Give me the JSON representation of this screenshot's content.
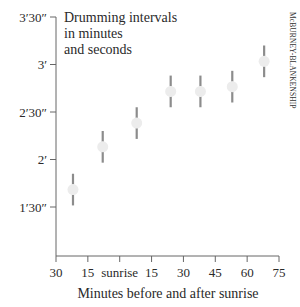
{
  "chart_data": {
    "type": "scatter",
    "title_lines": [
      "Drumming intervals",
      "in minutes",
      "and seconds"
    ],
    "xlabel": "Minutes before and after sunrise",
    "ylabel": "",
    "xlim": [
      -30,
      75
    ],
    "ylim_seconds": [
      60,
      210
    ],
    "x_ticks": [
      {
        "value": -30,
        "label": "30"
      },
      {
        "value": -15,
        "label": "15"
      },
      {
        "value": 0,
        "label": "sunrise"
      },
      {
        "value": 15,
        "label": "15"
      },
      {
        "value": 30,
        "label": "30"
      },
      {
        "value": 45,
        "label": "45"
      },
      {
        "value": 60,
        "label": "60"
      },
      {
        "value": 75,
        "label": "75"
      }
    ],
    "y_ticks": [
      {
        "value": 90,
        "label": "1′30″"
      },
      {
        "value": 120,
        "label": "2′"
      },
      {
        "value": 150,
        "label": "2′30″"
      },
      {
        "value": 180,
        "label": "3′"
      },
      {
        "value": 210,
        "label": "3′30″"
      }
    ],
    "grid": false,
    "legend": null,
    "series": [
      {
        "name": "Drumming interval (mean ± range)",
        "points": [
          {
            "x": -22,
            "y_seconds": 101,
            "y_label": "1′41″",
            "err_seconds": 10
          },
          {
            "x": -8,
            "y_seconds": 128,
            "y_label": "2′08″",
            "err_seconds": 10
          },
          {
            "x": 8,
            "y_seconds": 143,
            "y_label": "2′23″",
            "err_seconds": 10
          },
          {
            "x": 24,
            "y_seconds": 163,
            "y_label": "2′43″",
            "err_seconds": 10
          },
          {
            "x": 38,
            "y_seconds": 163,
            "y_label": "2′43″",
            "err_seconds": 10
          },
          {
            "x": 53,
            "y_seconds": 166,
            "y_label": "2′46″",
            "err_seconds": 10
          },
          {
            "x": 68,
            "y_seconds": 182,
            "y_label": "3′02″",
            "err_seconds": 10
          }
        ]
      }
    ],
    "annotations": [
      "McBURNEY-BLANKENSHIP"
    ]
  },
  "colors": {
    "point_fill": "#ececec",
    "error_bar": "#8c8c8c",
    "axis": "#666666",
    "text": "#2a2a2a"
  },
  "credit": "McBURNEY-BLANKENSHIP"
}
